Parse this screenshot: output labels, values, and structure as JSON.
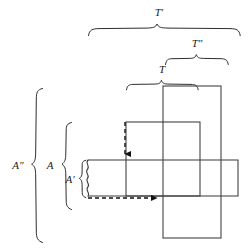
{
  "figure": {
    "background_color": "#ffffff",
    "line_color": "#3a3a3a",
    "brace_color": "#2e2e2e",
    "arrow_color": "#111111",
    "width": 250,
    "height": 251
  },
  "labels": {
    "t_prime": "T′",
    "t_double_prime": "T″",
    "t": "T",
    "a_double_prime": "A″",
    "a": "A",
    "a_prime": "A′"
  },
  "braces": {
    "top": [
      {
        "id": "t-prime-brace",
        "label": "T′",
        "orientation": "horizontal-down",
        "start": 88,
        "end": 240,
        "y": 28,
        "label_x": 159,
        "label_y": 13
      },
      {
        "id": "t-double-prime-brace",
        "label": "T″",
        "orientation": "horizontal-down",
        "start": 165,
        "end": 229,
        "y": 58,
        "label_x": 197,
        "label_y": 44
      },
      {
        "id": "t-brace",
        "label": "T",
        "orientation": "horizontal-down",
        "start": 126,
        "end": 199,
        "y": 84,
        "label_x": 162,
        "label_y": 70
      }
    ],
    "left": [
      {
        "id": "a-double-prime-brace",
        "label": "A″",
        "orientation": "vertical-right",
        "start": 88,
        "end": 243,
        "x": 36,
        "label_x": 18,
        "label_y": 166
      },
      {
        "id": "a-brace",
        "label": "A",
        "orientation": "vertical-right",
        "start": 122,
        "end": 210,
        "x": 66,
        "label_x": 50,
        "label_y": 166
      },
      {
        "id": "a-prime-brace",
        "label": "A′",
        "orientation": "vertical-right",
        "start": 160,
        "end": 198,
        "x": 82,
        "label_x": 70,
        "label_y": 180
      }
    ]
  },
  "rectangles": [
    {
      "id": "tall-rectangle",
      "name": "tall-vertical-rectangle",
      "x": 163,
      "y": 86,
      "width": 58,
      "height": 152
    },
    {
      "id": "middle-rectangle",
      "name": "middle-rectangle",
      "x": 126,
      "y": 122,
      "width": 74,
      "height": 74
    },
    {
      "id": "wide-rectangle",
      "name": "wide-horizontal-rectangle",
      "x": 88,
      "y": 160,
      "width": 150,
      "height": 36,
      "left_edge_style": "wavy-break"
    }
  ],
  "arrows": [
    {
      "id": "vertical-offset-arrow",
      "name": "vertical-dashed-arrow",
      "style": "dashed",
      "x1": 125,
      "y1": 122,
      "x2": 125,
      "y2": 160,
      "direction": "down"
    },
    {
      "id": "horizontal-offset-arrow",
      "name": "horizontal-dashed-arrow",
      "style": "dashed",
      "x1": 88,
      "y1": 198,
      "x2": 163,
      "y2": 198,
      "direction": "right"
    }
  ]
}
